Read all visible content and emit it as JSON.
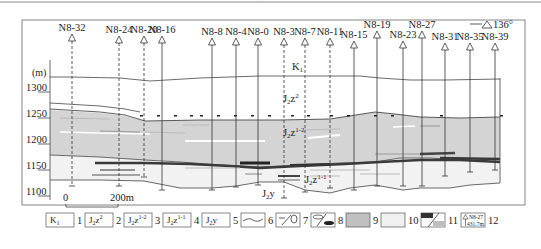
{
  "diagram": {
    "type": "geological-cross-section",
    "orientation_label": "136°",
    "y_axis": {
      "unit": "(m)",
      "ticks": [
        {
          "label": "1300",
          "y": 92
        },
        {
          "label": "1250",
          "y": 118
        },
        {
          "label": "1200",
          "y": 144
        },
        {
          "label": "1150",
          "y": 170
        },
        {
          "label": "1100",
          "y": 196
        }
      ]
    },
    "scale_bar": {
      "start": "0",
      "end": "200m"
    },
    "wells": [
      {
        "name": "N8-32",
        "x": 72,
        "label_y": 31,
        "bottom": 186,
        "dashed": true
      },
      {
        "name": "N8-24",
        "x": 119,
        "label_y": 33,
        "bottom": 186,
        "dashed": true
      },
      {
        "name": "N8-20",
        "x": 144,
        "label_y": 33,
        "bottom": 177,
        "dashed": true
      },
      {
        "name": "N8-16",
        "x": 162,
        "label_y": 33,
        "bottom": 190,
        "dashed": false
      },
      {
        "name": "N8-8",
        "x": 212,
        "label_y": 35,
        "bottom": 190,
        "dashed": false
      },
      {
        "name": "N8-4",
        "x": 236,
        "label_y": 35,
        "bottom": 187,
        "dashed": false
      },
      {
        "name": "N8-0",
        "x": 258,
        "label_y": 35,
        "bottom": 185,
        "dashed": false
      },
      {
        "name": "N8-3",
        "x": 284,
        "label_y": 35,
        "bottom": 198,
        "dashed": true
      },
      {
        "name": "N8-7",
        "x": 305,
        "label_y": 35,
        "bottom": 192,
        "dashed": true
      },
      {
        "name": "N8-11",
        "x": 330,
        "label_y": 35,
        "bottom": 188,
        "dashed": true
      },
      {
        "name": "N8-15",
        "x": 354,
        "label_y": 38,
        "bottom": 190,
        "dashed": false
      },
      {
        "name": "N8-19",
        "x": 377,
        "label_y": 28,
        "bottom": 186,
        "dashed": false
      },
      {
        "name": "N8-23",
        "x": 403,
        "label_y": 38,
        "bottom": 186,
        "dashed": false
      },
      {
        "name": "N8-27",
        "x": 422,
        "label_y": 28,
        "bottom": 186,
        "dashed": false
      },
      {
        "name": "N8-31",
        "x": 445,
        "label_y": 40,
        "bottom": 176,
        "dashed": false
      },
      {
        "name": "N8-35",
        "x": 470,
        "label_y": 40,
        "bottom": 172,
        "dashed": false
      },
      {
        "name": "N8-39",
        "x": 495,
        "label_y": 40,
        "bottom": 170,
        "dashed": false
      }
    ],
    "strata_labels": [
      {
        "id": "k1",
        "base": "K",
        "sub": "1",
        "sup": "",
        "x": 292,
        "y": 70
      },
      {
        "id": "j2z2",
        "base": "J",
        "sub": "2",
        "mid": "z",
        "sup": "2",
        "x": 283,
        "y": 102
      },
      {
        "id": "j2z1-2",
        "base": "J",
        "sub": "2",
        "mid": "z",
        "sup": "1-2",
        "x": 283,
        "y": 136
      },
      {
        "id": "j2z1-1",
        "base": "J",
        "sub": "2",
        "mid": "z",
        "sup": "1-1",
        "x": 305,
        "y": 183
      },
      {
        "id": "j2y",
        "base": "J",
        "sub": "2",
        "mid": "y",
        "sup": "",
        "x": 262,
        "y": 197
      }
    ],
    "colors": {
      "frame": "#555555",
      "gray_fill": "#d4d4d4",
      "light_fill": "#f0f0f0",
      "dark_band": "#3a3a3a",
      "mid_band": "#8a8a8a",
      "white_lens": "#ffffff"
    }
  },
  "legend": {
    "items": [
      {
        "num": "1",
        "kind": "text",
        "text": "K",
        "sub": "1",
        "sup": ""
      },
      {
        "num": "2",
        "kind": "text",
        "text": "J",
        "sub": "2",
        "mid": "z",
        "sup": "2"
      },
      {
        "num": "3",
        "kind": "text",
        "text": "J",
        "sub": "2",
        "mid": "z",
        "sup": "1-2"
      },
      {
        "num": "4",
        "kind": "text",
        "text": "J",
        "sub": "2",
        "mid": "z",
        "sup": "1-1"
      },
      {
        "num": "5",
        "kind": "text",
        "text": "J",
        "sub": "2",
        "mid": "y",
        "sup": ""
      },
      {
        "num": "6",
        "kind": "wavy-line-symbol"
      },
      {
        "num": "7",
        "kind": "fault-symbol"
      },
      {
        "num": "8",
        "kind": "lens-symbol"
      },
      {
        "num": "9",
        "kind": "gray-fill"
      },
      {
        "num": "10",
        "kind": "light-fill"
      },
      {
        "num": "11",
        "kind": "band-symbol"
      },
      {
        "num": "12",
        "kind": "well-key",
        "well": "N8-27",
        "depth": "431.7m"
      }
    ]
  }
}
